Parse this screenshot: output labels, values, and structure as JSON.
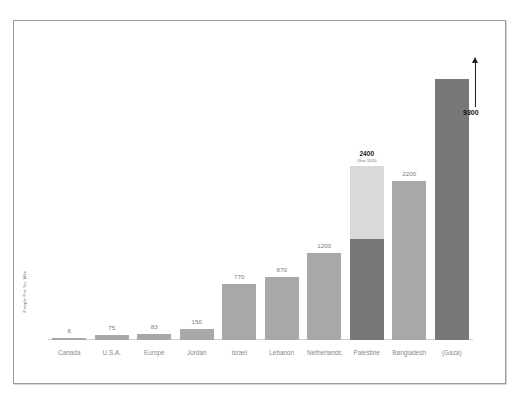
{
  "chart_data": {
    "type": "bar",
    "title": "",
    "subtitle": "",
    "xlabel": "",
    "ylabel": "People Per Sq. Mile",
    "ylim": [
      0,
      9300
    ],
    "grid": false,
    "legend": null,
    "categories": [
      "Canada",
      "U.S.A.",
      "Europe",
      "Jordan",
      "Israel",
      "Lebanon",
      "Netherlands",
      "Palestine",
      "Bangladesh",
      "(Gaza)"
    ],
    "values": [
      8,
      75,
      83,
      150,
      770,
      870,
      1200,
      2400,
      2200,
      9300
    ],
    "value_labels": [
      "8",
      "75",
      "83",
      "150",
      "770",
      "870",
      "1200",
      "2400",
      "2200",
      "9300"
    ],
    "bars": [
      {
        "category": "Canada",
        "value": 8,
        "label": "8",
        "label_bold": false,
        "sublabel": "",
        "color": "#a8a8a8",
        "stacked": false,
        "truncated": false
      },
      {
        "category": "U.S.A.",
        "value": 75,
        "label": "75",
        "label_bold": false,
        "sublabel": "",
        "color": "#a8a8a8",
        "stacked": false,
        "truncated": false
      },
      {
        "category": "Europe",
        "value": 83,
        "label": "83",
        "label_bold": false,
        "sublabel": "",
        "color": "#a8a8a8",
        "stacked": false,
        "truncated": false
      },
      {
        "category": "Jordan",
        "value": 150,
        "label": "150",
        "label_bold": false,
        "sublabel": "",
        "color": "#a8a8a8",
        "stacked": false,
        "truncated": false
      },
      {
        "category": "Israel",
        "value": 770,
        "label": "770",
        "label_bold": false,
        "sublabel": "",
        "color": "#a8a8a8",
        "stacked": false,
        "truncated": false
      },
      {
        "category": "Lebanon",
        "value": 870,
        "label": "870",
        "label_bold": false,
        "sublabel": "",
        "color": "#a8a8a8",
        "stacked": false,
        "truncated": false
      },
      {
        "category": "Netherlands",
        "value": 1200,
        "label": "1200",
        "label_bold": false,
        "sublabel": "",
        "color": "#a8a8a8",
        "stacked": false,
        "truncated": false
      },
      {
        "category": "Palestine",
        "value": 2400,
        "label": "2400",
        "label_bold": true,
        "sublabel": "(Year 2020)",
        "color": "#d9d9d9",
        "stacked": true,
        "lower_value": 1400,
        "lower_label": "1400",
        "lower_color": "#787878",
        "truncated": false
      },
      {
        "category": "Bangladesh",
        "value": 2200,
        "label": "2200",
        "label_bold": false,
        "sublabel": "",
        "color": "#a8a8a8",
        "stacked": false,
        "truncated": false
      },
      {
        "category": "(Gaza)",
        "value": 9300,
        "label": "9300",
        "label_bold": true,
        "sublabel": "",
        "color": "#787878",
        "stacked": false,
        "truncated": true
      }
    ],
    "annotation": {
      "text": "9300",
      "icon": "up-arrow-icon",
      "describes": "(Gaza)"
    }
  }
}
